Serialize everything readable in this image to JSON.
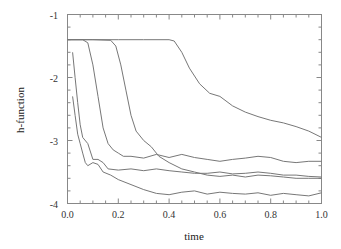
{
  "chart_data": {
    "type": "line",
    "title": "",
    "xlabel": "time",
    "ylabel": "h-function",
    "xlim": [
      0.0,
      1.0
    ],
    "ylim": [
      -4,
      -1
    ],
    "grid": false,
    "legend": null,
    "x_ticks": [
      "0.0",
      "0.2",
      "0.4",
      "0.6",
      "0.8",
      "1.0"
    ],
    "y_ticks": [
      "-1",
      "-2",
      "-3",
      "-4"
    ],
    "series": [
      {
        "name": "curve-1",
        "points": [
          [
            0.0,
            -1.4
          ],
          [
            0.1,
            -1.4
          ],
          [
            0.2,
            -1.4
          ],
          [
            0.3,
            -1.4
          ],
          [
            0.4,
            -1.4
          ],
          [
            0.42,
            -1.42
          ],
          [
            0.45,
            -1.6
          ],
          [
            0.48,
            -1.85
          ],
          [
            0.52,
            -2.1
          ],
          [
            0.56,
            -2.25
          ],
          [
            0.6,
            -2.3
          ],
          [
            0.65,
            -2.45
          ],
          [
            0.7,
            -2.55
          ],
          [
            0.75,
            -2.62
          ],
          [
            0.8,
            -2.68
          ],
          [
            0.85,
            -2.72
          ],
          [
            0.9,
            -2.78
          ],
          [
            0.95,
            -2.85
          ],
          [
            1.0,
            -2.95
          ]
        ]
      },
      {
        "name": "curve-2",
        "points": [
          [
            0.0,
            -1.4
          ],
          [
            0.1,
            -1.4
          ],
          [
            0.17,
            -1.41
          ],
          [
            0.19,
            -1.5
          ],
          [
            0.21,
            -1.8
          ],
          [
            0.23,
            -2.2
          ],
          [
            0.25,
            -2.6
          ],
          [
            0.27,
            -2.85
          ],
          [
            0.3,
            -3.0
          ],
          [
            0.33,
            -3.1
          ],
          [
            0.36,
            -3.25
          ],
          [
            0.4,
            -3.35
          ],
          [
            0.45,
            -3.45
          ],
          [
            0.5,
            -3.5
          ],
          [
            0.55,
            -3.55
          ],
          [
            0.6,
            -3.57
          ],
          [
            0.65,
            -3.55
          ],
          [
            0.7,
            -3.58
          ],
          [
            0.75,
            -3.55
          ],
          [
            0.8,
            -3.56
          ],
          [
            0.85,
            -3.58
          ],
          [
            0.9,
            -3.6
          ],
          [
            0.95,
            -3.6
          ],
          [
            1.0,
            -3.6
          ]
        ]
      },
      {
        "name": "curve-3",
        "points": [
          [
            0.0,
            -1.4
          ],
          [
            0.06,
            -1.4
          ],
          [
            0.08,
            -1.45
          ],
          [
            0.1,
            -1.8
          ],
          [
            0.12,
            -2.3
          ],
          [
            0.14,
            -2.8
          ],
          [
            0.16,
            -3.05
          ],
          [
            0.18,
            -3.15
          ],
          [
            0.2,
            -3.2
          ],
          [
            0.22,
            -3.25
          ],
          [
            0.25,
            -3.25
          ],
          [
            0.3,
            -3.28
          ],
          [
            0.35,
            -3.22
          ],
          [
            0.4,
            -3.27
          ],
          [
            0.45,
            -3.22
          ],
          [
            0.5,
            -3.27
          ],
          [
            0.55,
            -3.3
          ],
          [
            0.6,
            -3.33
          ],
          [
            0.65,
            -3.3
          ],
          [
            0.7,
            -3.28
          ],
          [
            0.75,
            -3.25
          ],
          [
            0.8,
            -3.27
          ],
          [
            0.85,
            -3.33
          ],
          [
            0.9,
            -3.35
          ],
          [
            0.95,
            -3.33
          ],
          [
            1.0,
            -3.33
          ]
        ]
      },
      {
        "name": "curve-4",
        "points": [
          [
            0.02,
            -1.6
          ],
          [
            0.03,
            -2.0
          ],
          [
            0.04,
            -2.4
          ],
          [
            0.05,
            -2.75
          ],
          [
            0.06,
            -2.95
          ],
          [
            0.08,
            -3.05
          ],
          [
            0.1,
            -3.3
          ],
          [
            0.12,
            -3.3
          ],
          [
            0.14,
            -3.35
          ],
          [
            0.16,
            -3.45
          ],
          [
            0.2,
            -3.47
          ],
          [
            0.25,
            -3.45
          ],
          [
            0.3,
            -3.48
          ],
          [
            0.35,
            -3.45
          ],
          [
            0.4,
            -3.48
          ],
          [
            0.45,
            -3.5
          ],
          [
            0.5,
            -3.52
          ],
          [
            0.55,
            -3.52
          ],
          [
            0.6,
            -3.5
          ],
          [
            0.65,
            -3.53
          ],
          [
            0.7,
            -3.52
          ],
          [
            0.75,
            -3.5
          ],
          [
            0.8,
            -3.52
          ],
          [
            0.85,
            -3.55
          ],
          [
            0.9,
            -3.55
          ],
          [
            0.95,
            -3.57
          ],
          [
            1.0,
            -3.58
          ]
        ]
      },
      {
        "name": "curve-5",
        "points": [
          [
            0.02,
            -2.3
          ],
          [
            0.03,
            -2.6
          ],
          [
            0.04,
            -2.9
          ],
          [
            0.05,
            -3.05
          ],
          [
            0.06,
            -3.2
          ],
          [
            0.07,
            -3.35
          ],
          [
            0.08,
            -3.4
          ],
          [
            0.1,
            -3.35
          ],
          [
            0.12,
            -3.38
          ],
          [
            0.14,
            -3.5
          ],
          [
            0.17,
            -3.55
          ],
          [
            0.2,
            -3.62
          ],
          [
            0.25,
            -3.7
          ],
          [
            0.3,
            -3.78
          ],
          [
            0.35,
            -3.84
          ],
          [
            0.4,
            -3.86
          ],
          [
            0.45,
            -3.82
          ],
          [
            0.5,
            -3.8
          ],
          [
            0.55,
            -3.85
          ],
          [
            0.6,
            -3.82
          ],
          [
            0.65,
            -3.84
          ],
          [
            0.7,
            -3.85
          ],
          [
            0.75,
            -3.83
          ],
          [
            0.8,
            -3.87
          ],
          [
            0.85,
            -3.84
          ],
          [
            0.9,
            -3.86
          ],
          [
            0.95,
            -3.88
          ],
          [
            1.0,
            -3.83
          ]
        ]
      }
    ]
  }
}
